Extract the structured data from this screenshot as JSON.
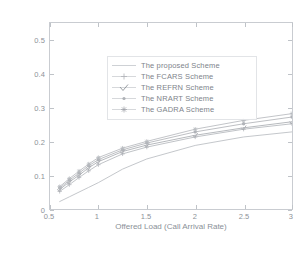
{
  "chart_data": {
    "type": "line",
    "title": "",
    "xlabel": "Offered Load (Call Arrival Rate)",
    "ylabel": "Call Dropping Probability",
    "xlim": [
      0.5,
      3
    ],
    "ylim": [
      0,
      0.55
    ],
    "xticks": [
      "0.5",
      "1",
      "1.5",
      "2",
      "2.5",
      "3"
    ],
    "xtick_values": [
      0.5,
      1,
      1.5,
      2,
      2.5,
      3
    ],
    "yticks": [
      "0",
      "0.1",
      "0.2",
      "0.3",
      "0.4",
      "0.5"
    ],
    "ytick_values": [
      0,
      0.1,
      0.2,
      0.3,
      0.4,
      0.5
    ],
    "grid": false,
    "legend_position": "upper-left",
    "x": [
      0.6,
      0.7,
      0.8,
      0.9,
      1.0,
      1.25,
      1.5,
      2.0,
      2.5,
      3.0
    ],
    "series": [
      {
        "name": "The proposed Scheme",
        "marker": "line",
        "values": [
          0.022,
          0.036,
          0.05,
          0.064,
          0.078,
          0.118,
          0.148,
          0.188,
          0.213,
          0.228
        ]
      },
      {
        "name": "The FCARS Scheme",
        "marker": "plus",
        "values": [
          0.052,
          0.072,
          0.093,
          0.113,
          0.131,
          0.163,
          0.183,
          0.213,
          0.236,
          0.252
        ]
      },
      {
        "name": "The REFRN Scheme",
        "marker": "check",
        "values": [
          0.058,
          0.08,
          0.1,
          0.122,
          0.14,
          0.17,
          0.189,
          0.218,
          0.24,
          0.258
        ]
      },
      {
        "name": "The NRART Scheme",
        "marker": "dot",
        "values": [
          0.062,
          0.085,
          0.106,
          0.128,
          0.146,
          0.175,
          0.195,
          0.228,
          0.252,
          0.272
        ]
      },
      {
        "name": "The GADRA Scheme",
        "marker": "star",
        "values": [
          0.066,
          0.09,
          0.112,
          0.133,
          0.152,
          0.18,
          0.2,
          0.236,
          0.262,
          0.282
        ]
      }
    ],
    "series_colors": [
      "#b9bcc1",
      "#b4b7bc",
      "#a8abb0",
      "#b0b3b8",
      "#b6b9be"
    ]
  }
}
